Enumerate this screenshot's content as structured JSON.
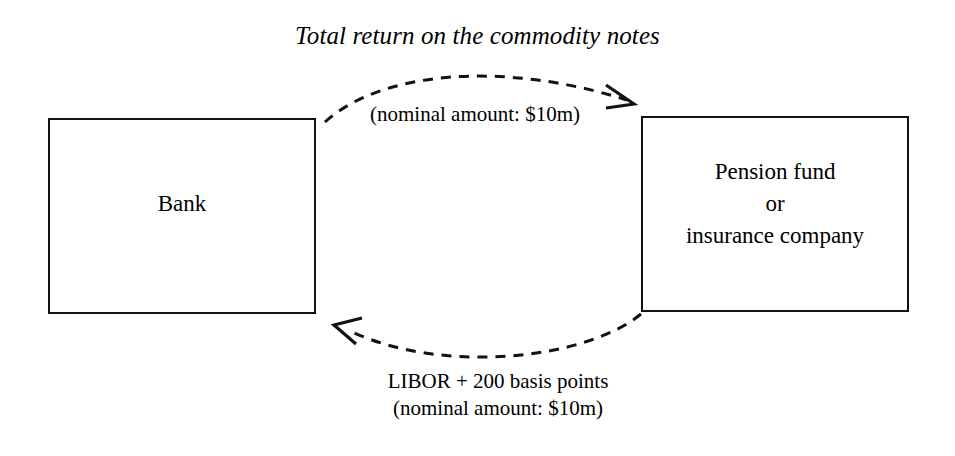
{
  "diagram": {
    "title": "Total return on the commodity notes",
    "type": "swap-flow-diagram",
    "boxes": [
      {
        "id": "bank",
        "label": "Bank"
      },
      {
        "id": "pension",
        "label": "Pension fund\nor\ninsurance company"
      }
    ],
    "flows": [
      {
        "id": "top-flow",
        "direction": "bank-to-pension",
        "title_label": "Total return on the commodity notes",
        "sub_label": "(nominal amount: $10m)",
        "style": "dashed-curved-arrow"
      },
      {
        "id": "bottom-flow",
        "direction": "pension-to-bank",
        "line1": "LIBOR + 200 basis points",
        "line2": "(nominal amount: $10m)",
        "label": "LIBOR + 200 basis points\n(nominal amount: $10m)",
        "style": "dashed-curved-arrow"
      }
    ],
    "colors": {
      "background": "#ffffff",
      "stroke": "#121212",
      "text": "#000000"
    }
  }
}
